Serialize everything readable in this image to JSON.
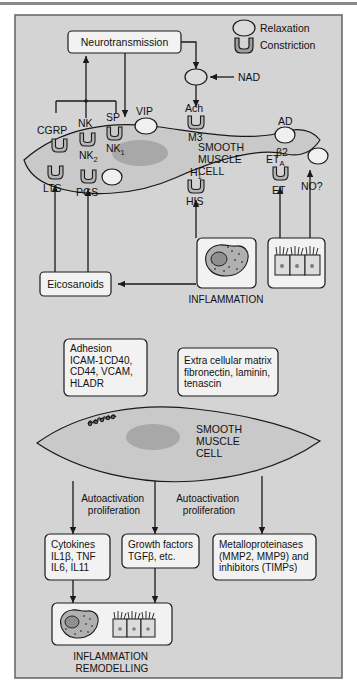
{
  "figure": {
    "background": "#d4d4d4",
    "border_color": "#6b6b6b",
    "box_fill": "#f2f2f2",
    "cell_fill": "#c9c9c9",
    "nucleus_fill": "#a8a8a8",
    "receptor_fill": "#b5b5b5",
    "line_color": "#1a1a1a"
  },
  "legend": {
    "relaxation": "Relaxation",
    "constriction": "Constriction"
  },
  "panel_top": {
    "neurotransmission_box": "Neurotransmission",
    "nad_label": "NAD",
    "cell_label_line1": "SMOOTH",
    "cell_label_line2": "MUSCLE",
    "cell_label_line3": "CELL",
    "receptors": [
      {
        "ligand": "CGRP",
        "receptor": "",
        "type": "constriction"
      },
      {
        "ligand": "NK",
        "receptor": "NK",
        "receptor_sub": "2",
        "type": "constriction"
      },
      {
        "ligand": "SP",
        "receptor": "NK",
        "receptor_sub": "1",
        "type": "constriction"
      },
      {
        "ligand": "VIP",
        "receptor": "",
        "type": "relaxation"
      },
      {
        "ligand": "Ach",
        "receptor": "M3",
        "type": "constriction"
      },
      {
        "ligand": "AD",
        "receptor": "β2",
        "type": "relaxation"
      },
      {
        "ligand": "LTS",
        "receptor": "",
        "type": "constriction"
      },
      {
        "ligand": "PGS",
        "receptor": "",
        "type": "constriction"
      },
      {
        "ligand": "HIS",
        "receptor": "H",
        "receptor_sub": "1",
        "type": "constriction"
      },
      {
        "ligand": "ET",
        "receptor": "ET",
        "receptor_sub": "A",
        "type": "constriction"
      },
      {
        "ligand": "NO?",
        "receptor": "",
        "type": "relaxation"
      }
    ],
    "eicosanoids_box": "Eicosanoids",
    "inflammation_label": "INFLAMMATION"
  },
  "panel_bottom": {
    "adhesion_box": [
      "Adhesion",
      "ICAM-1CD40,",
      "CD44, VCAM,",
      "HLADR"
    ],
    "ecm_box": [
      "Extra cellular matrix",
      "fibronectin, laminin,",
      "tenascin"
    ],
    "cell_label_line1": "SMOOTH",
    "cell_label_line2": "MUSCLE",
    "cell_label_line3": "CELL",
    "autoactivation_left": [
      "Autoactivation",
      "proliferation"
    ],
    "autoactivation_right": [
      "Autoactivation",
      "proliferation"
    ],
    "cytokines_box": [
      "Cytokines",
      "IL1β, TNF",
      "IL6, IL11"
    ],
    "growth_factors_box": [
      "Growth factors",
      "TGFβ, etc."
    ],
    "mmp_box": [
      "Metalloproteinases",
      "(MMP2, MMP9) and",
      "inhibitors (TIMPs)"
    ],
    "outcome_label_line1": "INFLAMMATION",
    "outcome_label_line2": "REMODELLING"
  }
}
